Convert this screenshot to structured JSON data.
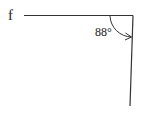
{
  "diagram": {
    "line_label": "f",
    "angle_label": "88°",
    "colors": {
      "stroke": "#333333",
      "text": "#222222",
      "background": "#ffffff"
    }
  }
}
